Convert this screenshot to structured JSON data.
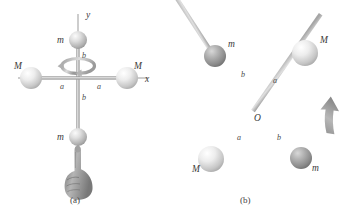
{
  "figure": {
    "background_color": "#ffffff",
    "panels": [
      {
        "id": "a",
        "caption": "(a)",
        "description": "Cross of two rods on x and y axes with four spheres, spun about the y-axis by a hand",
        "axes": [
          {
            "name": "y",
            "label": "y",
            "orientation": "vertical"
          },
          {
            "name": "x",
            "label": "x",
            "orientation": "horizontal"
          }
        ],
        "masses": [
          {
            "label": "m",
            "position": "top",
            "size": "small",
            "color": "#c9c9c9"
          },
          {
            "label": "M",
            "position": "left",
            "size": "large",
            "color": "#cfcfcf"
          },
          {
            "label": "M",
            "position": "right",
            "size": "large",
            "color": "#cfcfcf"
          },
          {
            "label": "m",
            "position": "bottom",
            "size": "small",
            "color": "#c9c9c9"
          }
        ],
        "segments": [
          {
            "label": "a",
            "from": "origin",
            "to": "left M"
          },
          {
            "label": "a",
            "from": "origin",
            "to": "right M"
          },
          {
            "label": "b",
            "from": "origin",
            "to": "top m"
          },
          {
            "label": "b",
            "from": "origin",
            "to": "bottom m"
          }
        ],
        "rotation": {
          "type": "spin-ring",
          "axis": "y",
          "sense": "counterclockwise"
        },
        "hand": {
          "gesture": "index-finger-pointing-up",
          "color": "#8a8a8a"
        }
      },
      {
        "id": "b",
        "caption": "(b)",
        "description": "The same cross tilted, rotating, with center O and an upward curved arrow",
        "center_label": "O",
        "masses": [
          {
            "label": "m",
            "position": "upper-left",
            "size": "medium",
            "color": "#9e9e9e"
          },
          {
            "label": "M",
            "position": "upper-right",
            "size": "large",
            "color": "#e8e8e8"
          },
          {
            "label": "M",
            "position": "lower-left",
            "size": "large",
            "color": "#e4e4e4"
          },
          {
            "label": "m",
            "position": "lower-right",
            "size": "medium",
            "color": "#9e9e9e"
          }
        ],
        "segments": [
          {
            "label": "b",
            "from": "O",
            "to": "upper-left m"
          },
          {
            "label": "a",
            "from": "O",
            "to": "upper-right M"
          },
          {
            "label": "a",
            "from": "O",
            "to": "lower-left M"
          },
          {
            "label": "b",
            "from": "O",
            "to": "lower-right m"
          }
        ],
        "motion_arrow": {
          "direction": "up",
          "style": "curved-block-arrow",
          "color": "#9a9a9a"
        }
      }
    ]
  }
}
